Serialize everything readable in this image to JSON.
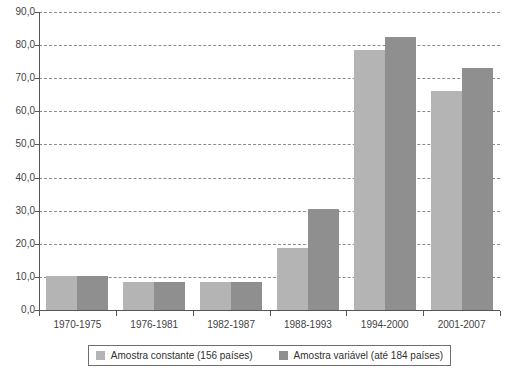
{
  "chart_data": {
    "type": "bar",
    "title": "",
    "subtitle": "",
    "xlabel": "",
    "ylabel": "",
    "grid": true,
    "legend_position": "bottom",
    "ylim": [
      0,
      90
    ],
    "ytick_step": 10,
    "ytick_labels": [
      "0,0",
      "10,0",
      "20,0",
      "30,0",
      "40,0",
      "50,0",
      "60,0",
      "70,0",
      "80,0",
      "90,0"
    ],
    "ytick_values": [
      0,
      10,
      20,
      30,
      40,
      50,
      60,
      70,
      80,
      90
    ],
    "categories": [
      "1970-1975",
      "1976-1981",
      "1982-1987",
      "1988-1993",
      "1994-2000",
      "2001-2007"
    ],
    "series": [
      {
        "name": "Amostra constante (156 países)",
        "color": "#b4b4b4",
        "values": [
          10.2,
          8.5,
          8.5,
          18.8,
          78.5,
          66.2
        ]
      },
      {
        "name": "Amostra variável (até 184 países)",
        "color": "#8f8f8f",
        "values": [
          10.2,
          8.5,
          8.6,
          30.6,
          82.4,
          73.0
        ]
      }
    ]
  },
  "legend": {
    "entries": [
      {
        "label": "Amostra constante (156 países)",
        "swatch": "series-a"
      },
      {
        "label": "Amostra variável (até 184 países)",
        "swatch": "series-b"
      }
    ]
  }
}
